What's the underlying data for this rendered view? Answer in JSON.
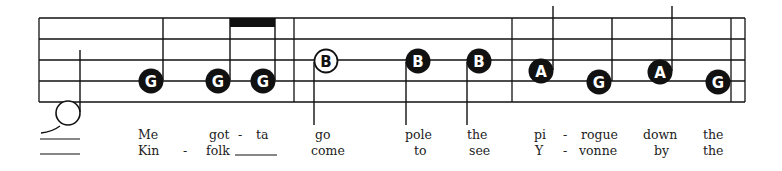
{
  "staff": {
    "line_ys": [
      18,
      39,
      60,
      81,
      102
    ],
    "left_x": 39,
    "right_x": 745,
    "barlines_x": [
      294,
      512,
      731,
      745
    ],
    "ink_color": "#111111"
  },
  "notes": [
    {
      "letter": "",
      "style": "open-plain",
      "cx": 68,
      "cy": 113,
      "stem": "up-right"
    },
    {
      "letter": "G",
      "style": "filled",
      "cx": 151,
      "cy": 81,
      "stem": "up-right"
    },
    {
      "letter": "G",
      "style": "filled",
      "cx": 218,
      "cy": 81,
      "stem": "up-right"
    },
    {
      "letter": "G",
      "style": "filled",
      "cx": 263,
      "cy": 81,
      "stem": "up-right"
    },
    {
      "letter": "B",
      "style": "outlined",
      "cx": 326,
      "cy": 61,
      "stem": "down-left"
    },
    {
      "letter": "B",
      "style": "filled",
      "cx": 418,
      "cy": 61,
      "stem": "down-left"
    },
    {
      "letter": "B",
      "style": "filled",
      "cx": 479,
      "cy": 61,
      "stem": "down-left"
    },
    {
      "letter": "A",
      "style": "filled",
      "cx": 541,
      "cy": 71,
      "stem": "up-right"
    },
    {
      "letter": "G",
      "style": "filled",
      "cx": 599,
      "cy": 82,
      "stem": "up-right"
    },
    {
      "letter": "A",
      "style": "filled",
      "cx": 660,
      "cy": 72,
      "stem": "up-right"
    },
    {
      "letter": "G",
      "style": "filled",
      "cx": 718,
      "cy": 82,
      "stem": "up-right"
    }
  ],
  "beam": {
    "from_note": 2,
    "to_note": 3
  },
  "lyrics": {
    "verse1": [
      {
        "text": "Me",
        "x": 138
      },
      {
        "text": "got",
        "x": 209
      },
      {
        "text": "-",
        "x": 238
      },
      {
        "text": "ta",
        "x": 256
      },
      {
        "text": "go",
        "x": 315
      },
      {
        "text": "pole",
        "x": 405
      },
      {
        "text": "the",
        "x": 467
      },
      {
        "text": "pi",
        "x": 534
      },
      {
        "text": "-",
        "x": 563
      },
      {
        "text": "rogue",
        "x": 581
      },
      {
        "text": "down",
        "x": 643
      },
      {
        "text": "the",
        "x": 703
      }
    ],
    "verse2": [
      {
        "text": "Kin",
        "x": 138
      },
      {
        "text": "-",
        "x": 183
      },
      {
        "text": "folk",
        "x": 206
      },
      {
        "text": "come",
        "x": 311
      },
      {
        "text": "to",
        "x": 414
      },
      {
        "text": "see",
        "x": 469
      },
      {
        "text": "Y",
        "x": 535
      },
      {
        "text": "-",
        "x": 563
      },
      {
        "text": "vonne",
        "x": 579
      },
      {
        "text": "by",
        "x": 654
      },
      {
        "text": "the",
        "x": 703
      }
    ]
  }
}
